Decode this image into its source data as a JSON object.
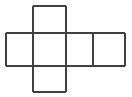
{
  "figure": {
    "background_color": "#ffffff",
    "stroke_color": "#404040",
    "fill_color": "#ffffff",
    "stroke_width": 2,
    "width": 132,
    "height": 97
  },
  "geometry": {
    "x_gridlines": [
      6,
      33,
      66,
      93,
      125
    ],
    "y_gridlines": [
      6,
      33,
      66,
      92
    ],
    "cell_width": 30,
    "cell_height": 29
  },
  "cells": [
    {
      "name": "top-square",
      "x": 33,
      "y": 6,
      "w": 33,
      "h": 27
    },
    {
      "name": "middle-left-square",
      "x": 6,
      "y": 33,
      "w": 27,
      "h": 33
    },
    {
      "name": "middle-center-square",
      "x": 33,
      "y": 33,
      "w": 33,
      "h": 33
    },
    {
      "name": "middle-right-square",
      "x": 66,
      "y": 33,
      "w": 27,
      "h": 33
    },
    {
      "name": "middle-far-right-square",
      "x": 93,
      "y": 33,
      "w": 32,
      "h": 33
    },
    {
      "name": "bottom-square",
      "x": 33,
      "y": 66,
      "w": 33,
      "h": 26
    }
  ],
  "edges": [
    {
      "name": "top-square-top-edge",
      "x1": 33,
      "y1": 6,
      "x2": 66,
      "y2": 6
    },
    {
      "name": "top-square-left-edge",
      "x1": 33,
      "y1": 6,
      "x2": 33,
      "y2": 33
    },
    {
      "name": "top-square-right-edge",
      "x1": 66,
      "y1": 6,
      "x2": 66,
      "y2": 33
    },
    {
      "name": "middle-row-top-edge",
      "x1": 6,
      "y1": 33,
      "x2": 125,
      "y2": 33
    },
    {
      "name": "middle-row-bottom-edge",
      "x1": 6,
      "y1": 66,
      "x2": 125,
      "y2": 66
    },
    {
      "name": "middle-row-left-edge",
      "x1": 6,
      "y1": 33,
      "x2": 6,
      "y2": 66
    },
    {
      "name": "middle-divider-1",
      "x1": 33,
      "y1": 33,
      "x2": 33,
      "y2": 66
    },
    {
      "name": "middle-divider-2",
      "x1": 66,
      "y1": 33,
      "x2": 66,
      "y2": 66
    },
    {
      "name": "middle-divider-3",
      "x1": 93,
      "y1": 33,
      "x2": 93,
      "y2": 66
    },
    {
      "name": "middle-row-right-edge",
      "x1": 125,
      "y1": 33,
      "x2": 125,
      "y2": 66
    },
    {
      "name": "bottom-square-left-edge",
      "x1": 33,
      "y1": 66,
      "x2": 33,
      "y2": 92
    },
    {
      "name": "bottom-square-right-edge",
      "x1": 66,
      "y1": 66,
      "x2": 66,
      "y2": 92
    },
    {
      "name": "bottom-square-bottom-edge",
      "x1": 33,
      "y1": 92,
      "x2": 66,
      "y2": 92
    }
  ]
}
